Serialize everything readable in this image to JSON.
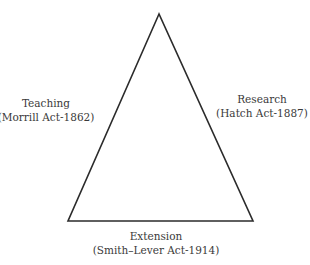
{
  "diagram": {
    "type": "triangle",
    "vertices": {
      "apex": [
        159,
        14
      ],
      "bottom_left": [
        68,
        221
      ],
      "bottom_right": [
        253,
        221
      ]
    },
    "stroke_color": "#2b2b2b",
    "text_color": "#3a3a3a",
    "labels": {
      "teaching": {
        "title": "Teaching",
        "subtitle": "(Morrill Act-1862)"
      },
      "research": {
        "title": "Research",
        "subtitle": "(Hatch Act-1887)"
      },
      "extension": {
        "title": "Extension",
        "subtitle": "(Smith–Lever Act-1914)"
      }
    }
  }
}
